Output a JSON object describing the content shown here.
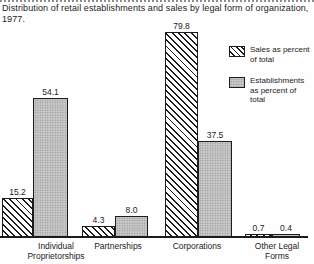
{
  "title": "Distribution of retail establishments and sales by legal form of organization, 1977.",
  "legend": {
    "items": [
      {
        "id": "sales",
        "label": "Sales as percent of total",
        "swatch": "hatched"
      },
      {
        "id": "establishments",
        "label": "Establishments as percent of total",
        "swatch": "gray-dotted"
      }
    ]
  },
  "colors": {
    "ink": "#1c1c1c",
    "paper": "#fefefe",
    "gray_fill": "#c9c9c9",
    "gray_dot": "#8e8e8e"
  },
  "chart_data": {
    "type": "bar",
    "title": "Distribution of retail establishments and sales by legal form of organization, 1977.",
    "categories": [
      "Individual Proprietorships",
      "Partnerships",
      "Corporations",
      "Other Legal Forms"
    ],
    "series": [
      {
        "name": "Sales as percent of total",
        "style": "hatched",
        "values": [
          15.2,
          4.3,
          79.8,
          0.7
        ]
      },
      {
        "name": "Establishments as percent of total",
        "style": "gray-dotted",
        "values": [
          54.1,
          8.0,
          37.5,
          0.4
        ]
      }
    ],
    "value_labels": true,
    "ylim": [
      0,
      85
    ],
    "grid": false,
    "axes": "x-baseline-only",
    "legend_position": "upper-right"
  }
}
